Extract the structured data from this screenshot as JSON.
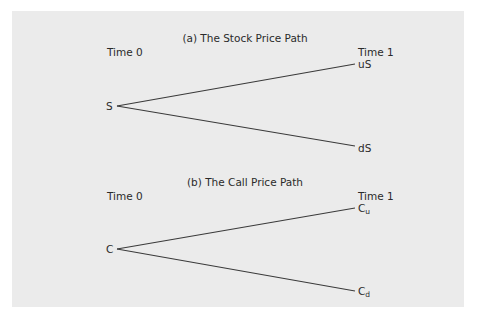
{
  "panel": {
    "background": "#ebebeb",
    "line_color": "#3a3a3a"
  },
  "diagrams": [
    {
      "title": "(a) The Stock Price Path",
      "time0_label": "Time 0",
      "time1_label": "Time 1",
      "root": "S",
      "up": "uS",
      "down": "dS"
    },
    {
      "title": "(b) The Call Price Path",
      "time0_label": "Time 0",
      "time1_label": "Time 1",
      "root": "C",
      "up_base": "C",
      "up_sub": "u",
      "down_base": "C",
      "down_sub": "d"
    }
  ]
}
